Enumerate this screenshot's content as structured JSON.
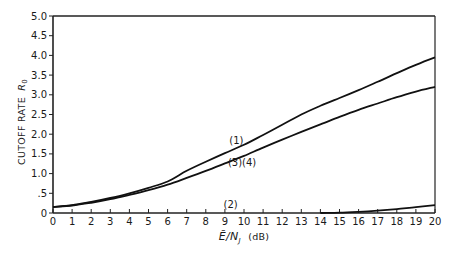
{
  "chart_data": {
    "type": "line",
    "title": "",
    "xlabel": "Ē/N_J (dB)",
    "ylabel": "CUTOFF RATE R0",
    "xlim": [
      0,
      20
    ],
    "ylim": [
      0,
      5.0
    ],
    "grid": false,
    "legend": "inline curve labels",
    "x_ticks": [
      "0",
      "1",
      "2",
      "3",
      "4",
      "5",
      "6",
      "7",
      "8",
      "9",
      "10",
      "11",
      "12",
      "13",
      "14",
      "15",
      "16",
      "17",
      "18",
      "19",
      "20"
    ],
    "y_ticks": [
      "0",
      ".5",
      "1.0",
      "1.5",
      "2.0",
      "2.5",
      "3.0",
      "3.5",
      "4.0",
      "4.5",
      "5.0"
    ],
    "series": [
      {
        "name": "(1)",
        "x": [
          0,
          1,
          2,
          3,
          4,
          5,
          6,
          7,
          8,
          9,
          10,
          11,
          12,
          13,
          14,
          15,
          16,
          17,
          18,
          19,
          20
        ],
        "values": [
          0.15,
          0.2,
          0.28,
          0.38,
          0.5,
          0.64,
          0.8,
          1.07,
          1.3,
          1.52,
          1.73,
          1.98,
          2.24,
          2.5,
          2.72,
          2.92,
          3.12,
          3.33,
          3.55,
          3.76,
          3.95
        ]
      },
      {
        "name": "(3)(4)",
        "x": [
          0,
          1,
          2,
          3,
          4,
          5,
          6,
          7,
          8,
          9,
          10,
          11,
          12,
          13,
          14,
          15,
          16,
          17,
          18,
          19,
          20
        ],
        "values": [
          0.15,
          0.19,
          0.26,
          0.35,
          0.46,
          0.58,
          0.72,
          0.89,
          1.07,
          1.26,
          1.45,
          1.66,
          1.86,
          2.06,
          2.25,
          2.44,
          2.62,
          2.78,
          2.94,
          3.08,
          3.2
        ]
      },
      {
        "name": "(2)",
        "x": [
          14,
          15,
          16,
          17,
          18,
          19,
          20
        ],
        "values": [
          0.0,
          0.01,
          0.03,
          0.06,
          0.1,
          0.15,
          0.2
        ]
      }
    ],
    "annotations": [
      {
        "text": "(1)",
        "x": 9.6,
        "y": 1.75
      },
      {
        "text": "(3)(4)",
        "x": 9.9,
        "y": 1.2
      },
      {
        "text": "(2)",
        "x": 9.3,
        "y": 0.12
      }
    ]
  },
  "labels": {
    "ylabel_main": "CUTOFF RATE",
    "ylabel_symbol": "R",
    "ylabel_sub": "0",
    "xlabel_main": "Ē/N",
    "xlabel_sub": "J",
    "xlabel_unit": "(dB)"
  }
}
